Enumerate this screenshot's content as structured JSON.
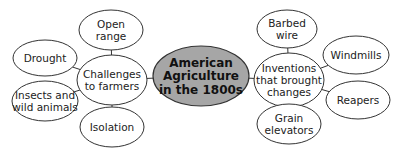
{
  "colors": {
    "background": "#ffffff",
    "center_fill": "#a6a6a6",
    "node_fill": "#ffffff",
    "stroke": "#333333"
  },
  "center": {
    "label_lines": [
      "American",
      "Agriculture",
      "in the 1800s"
    ],
    "cx": 201,
    "cy": 76,
    "rx": 48,
    "ry": 30
  },
  "left_hub": {
    "label_lines": [
      "Challenges",
      "to farmers"
    ],
    "cx": 112,
    "cy": 80,
    "rx": 35,
    "ry": 25,
    "children": [
      {
        "label_lines": [
          "Open",
          "range"
        ],
        "cx": 111,
        "cy": 30,
        "rx": 32,
        "ry": 20
      },
      {
        "label_lines": [
          "Drought"
        ],
        "cx": 45,
        "cy": 58,
        "rx": 32,
        "ry": 18
      },
      {
        "label_lines": [
          "Insects and",
          "wild animals"
        ],
        "cx": 45,
        "cy": 101,
        "rx": 33,
        "ry": 20
      },
      {
        "label_lines": [
          "Isolation"
        ],
        "cx": 112,
        "cy": 127,
        "rx": 32,
        "ry": 20
      }
    ]
  },
  "right_hub": {
    "label_lines": [
      "Inventions",
      "that brought",
      "changes"
    ],
    "cx": 289,
    "cy": 80,
    "rx": 35,
    "ry": 27,
    "children": [
      {
        "label_lines": [
          "Barbed",
          "wire"
        ],
        "cx": 287,
        "cy": 29,
        "rx": 30,
        "ry": 19
      },
      {
        "label_lines": [
          "Windmills"
        ],
        "cx": 356,
        "cy": 55,
        "rx": 33,
        "ry": 19
      },
      {
        "label_lines": [
          "Reapers"
        ],
        "cx": 358,
        "cy": 100,
        "rx": 32,
        "ry": 19
      },
      {
        "label_lines": [
          "Grain",
          "elevators"
        ],
        "cx": 289,
        "cy": 124,
        "rx": 32,
        "ry": 20
      }
    ]
  }
}
